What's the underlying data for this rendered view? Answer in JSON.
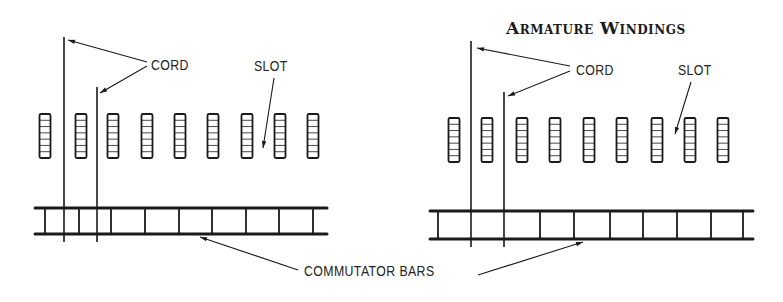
{
  "title": "Armature Windings",
  "labels": {
    "cord_left": "CORD",
    "slot_left": "SLOT",
    "cord_right": "CORD",
    "slot_right": "SLOT",
    "commutator": "COMMUTATOR BARS"
  },
  "diagrams": [
    {
      "name": "left-winding",
      "commutator": {
        "x1": 35,
        "x2": 327,
        "top": 208,
        "bottom": 234,
        "bars": [
          45,
          79,
          111,
          145,
          179,
          212,
          246,
          279,
          313
        ]
      },
      "cords": [
        {
          "x": 64,
          "top": 37,
          "bottom": 242
        },
        {
          "x": 97,
          "top": 87,
          "bottom": 242
        }
      ],
      "slots": {
        "centers": [
          45,
          81,
          113,
          147,
          180,
          213,
          247,
          280,
          313
        ],
        "top": 114,
        "bottom": 158,
        "cells": 7
      }
    },
    {
      "name": "right-winding",
      "commutator": {
        "x1": 430,
        "x2": 753,
        "top": 211,
        "bottom": 239,
        "bars": [
          438,
          540,
          574,
          610,
          643,
          677,
          711,
          743
        ]
      },
      "cords": [
        {
          "x": 471,
          "top": 41,
          "bottom": 247
        },
        {
          "x": 504,
          "top": 92,
          "bottom": 247
        }
      ],
      "slots": {
        "centers": [
          454,
          487,
          522,
          555,
          589,
          622,
          657,
          690,
          723
        ],
        "top": 118,
        "bottom": 162,
        "cells": 7
      }
    }
  ],
  "colors": {
    "ink": "#1a1a1a",
    "background": "#ffffff"
  }
}
